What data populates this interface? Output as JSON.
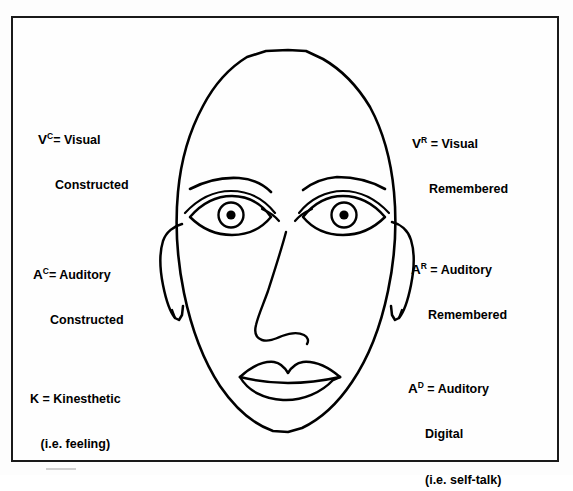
{
  "figure": {
    "name": "eye-accessing-cues-diagram",
    "border_color": "#1a1a1a",
    "ink_color": "#000000",
    "background_color": "#fdfdfd"
  },
  "labels": {
    "visual_constructed": {
      "symbol": "V",
      "superscript": "C",
      "equals": "= Visual",
      "line2": "Constructed"
    },
    "visual_remembered": {
      "symbol": "V",
      "superscript": "R",
      "equals": " = Visual",
      "line2": "Remembered"
    },
    "auditory_constructed": {
      "symbol": "A",
      "superscript": "C",
      "equals": "= Auditory",
      "line2": "Constructed"
    },
    "auditory_remembered": {
      "symbol": "A",
      "superscript": "R",
      "equals": " = Auditory",
      "line2": "Remembered"
    },
    "kinesthetic": {
      "line1": "K = Kinesthetic",
      "line2": "(i.e. feeling)"
    },
    "auditory_digital": {
      "symbol": "A",
      "superscript": "D",
      "equals": " = Auditory",
      "line2": "Digital",
      "line3": "(i.e. self-talk)"
    }
  }
}
